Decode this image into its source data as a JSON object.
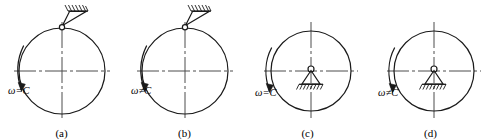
{
  "figure": {
    "type": "engineering-diagram",
    "background_color": "#ffffff",
    "line_color": "#1a1a1a",
    "centerline_color": "#4d4d4d"
  },
  "panels": [
    {
      "id": "a",
      "caption": "(a)",
      "omega_label": "ω=C",
      "support_type": "pin-hanging-from-ceiling",
      "support_position": "top",
      "rotation_arrow": "counterclockwise-left"
    },
    {
      "id": "b",
      "caption": "(b)",
      "omega_label": "ω≠C",
      "support_type": "pin-hanging-from-ceiling",
      "support_position": "top",
      "rotation_arrow": "counterclockwise-left"
    },
    {
      "id": "c",
      "caption": "(c)",
      "omega_label": "ω=C",
      "support_type": "pin-on-ground",
      "support_position": "center",
      "rotation_arrow": "counterclockwise-left"
    },
    {
      "id": "d",
      "caption": "(d)",
      "omega_label": "ω≠C",
      "support_type": "pin-on-ground",
      "support_position": "center",
      "rotation_arrow": "counterclockwise-left"
    }
  ]
}
